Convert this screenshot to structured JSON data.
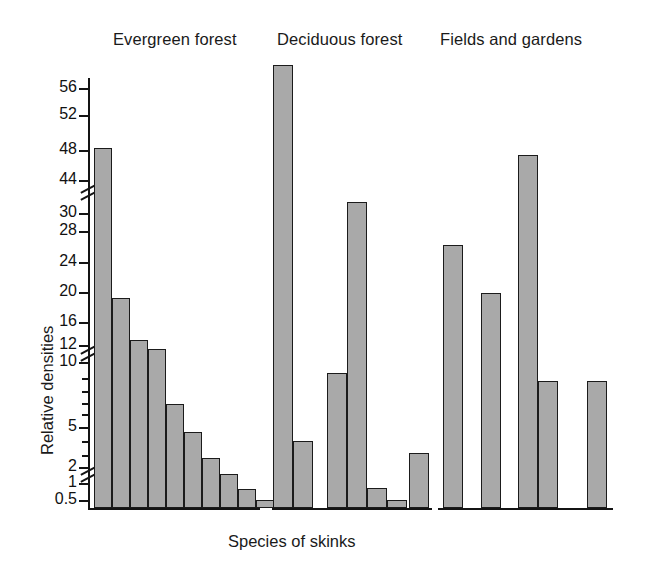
{
  "figure": {
    "xlabel": "Species of skinks",
    "ylabel": "Relative densities"
  },
  "groups": [
    {
      "key": "evergreen",
      "label": "Evergreen forest"
    },
    {
      "key": "deciduous",
      "label": "Deciduous forest"
    },
    {
      "key": "fields",
      "label": "Fields and gardens"
    }
  ],
  "axis": {
    "tick_labels": [
      "56",
      "52",
      "48",
      "44",
      "30",
      "28",
      "24",
      "20",
      "16",
      "12",
      "10",
      "5",
      "2",
      "1",
      "0.5"
    ],
    "breaks": [
      "between 44 and 30",
      "between 12 and 10",
      "between 2 and 1"
    ],
    "minor_ticks": [
      9,
      8,
      7,
      6,
      4,
      3
    ]
  },
  "colors": {
    "bar_fill": "#a9a9a9",
    "bar_stroke": "#1b1b1b",
    "axis": "#141414",
    "text": "#111111",
    "background": "#ffffff"
  },
  "chart_data": {
    "type": "bar",
    "title": "",
    "xlabel": "Species of skinks",
    "ylabel": "Relative densities",
    "ylim": [
      0,
      58
    ],
    "grid": false,
    "legend": "none",
    "y_axis_note": "Broken / compressed axis with three breaks: between 44 and 30, between 12 and 10, and between 2 and 1. Tick spacing below 12 is log-like.",
    "y_tick_labels": [
      "56",
      "52",
      "48",
      "44",
      "30",
      "28",
      "24",
      "20",
      "16",
      "12",
      "10",
      "5",
      "2",
      "1",
      "0.5"
    ],
    "series": [
      {
        "name": "Evergreen forest",
        "categories": [
          "sp1",
          "sp2",
          "sp3",
          "sp4",
          "sp5",
          "sp6",
          "sp7",
          "sp8",
          "sp9",
          "sp10"
        ],
        "values": [
          48,
          17,
          11.5,
          10.5,
          6,
          4,
          2,
          1.3,
          0.8,
          0.4
        ]
      },
      {
        "name": "Deciduous forest",
        "categories": [
          "sp1",
          "sp2",
          "sp3",
          "sp4",
          "sp5",
          "sp6",
          "sp7",
          "sp8"
        ],
        "values": [
          58,
          3,
          8.5,
          31,
          0.8,
          0.3,
          2,
          0
        ]
      },
      {
        "name": "Fields and gardens",
        "categories": [
          "sp1",
          "sp2",
          "sp3",
          "sp4",
          "sp5",
          "sp6",
          "sp7"
        ],
        "values": [
          25,
          18.5,
          47,
          6.5,
          0,
          6.5,
          0
        ]
      }
    ]
  },
  "layout": {
    "group_title_positions": [
      {
        "x": 113,
        "y": 30
      },
      {
        "x": 277,
        "y": 30
      },
      {
        "x": 440,
        "y": 30
      }
    ],
    "ylabel_pos": {
      "x": 38,
      "y": 455
    },
    "xlabel_pos": {
      "x": 228,
      "y": 532
    },
    "baselines": [
      {
        "x": 90,
        "y": 508,
        "w": 170
      },
      {
        "x": 272,
        "y": 508,
        "w": 160
      },
      {
        "x": 438,
        "y": 508,
        "w": 175
      }
    ],
    "axis_line": {
      "x": 88,
      "y": 78,
      "h": 432
    },
    "y_ticks": [
      {
        "label": "56",
        "y": 88,
        "kind": "major"
      },
      {
        "label": "52",
        "y": 115,
        "kind": "major"
      },
      {
        "label": "48",
        "y": 150,
        "kind": "major"
      },
      {
        "label": "44",
        "y": 180,
        "kind": "major"
      },
      {
        "label": "30",
        "y": 213,
        "kind": "major"
      },
      {
        "label": "28",
        "y": 231,
        "kind": "major"
      },
      {
        "label": "24",
        "y": 262,
        "kind": "major"
      },
      {
        "label": "20",
        "y": 292,
        "kind": "major"
      },
      {
        "label": "16",
        "y": 322,
        "kind": "major"
      },
      {
        "label": "12",
        "y": 345,
        "kind": "major"
      },
      {
        "label": "10",
        "y": 362,
        "kind": "major"
      },
      {
        "label": "",
        "y": 378,
        "kind": "minor"
      },
      {
        "label": "",
        "y": 391,
        "kind": "minor"
      },
      {
        "label": "",
        "y": 403,
        "kind": "minor"
      },
      {
        "label": "",
        "y": 414,
        "kind": "minor"
      },
      {
        "label": "5",
        "y": 427,
        "kind": "major"
      },
      {
        "label": "",
        "y": 441,
        "kind": "minor"
      },
      {
        "label": "",
        "y": 455,
        "kind": "minor"
      },
      {
        "label": "2",
        "y": 467,
        "kind": "major"
      },
      {
        "label": "1",
        "y": 483,
        "kind": "major"
      },
      {
        "label": "0.5",
        "y": 500,
        "kind": "major"
      }
    ],
    "breaks": [
      {
        "y": 192
      },
      {
        "y": 353
      },
      {
        "y": 474
      }
    ],
    "bars": [
      {
        "group": "evergreen",
        "x": 94,
        "w": 18,
        "top": 148
      },
      {
        "group": "evergreen",
        "x": 112,
        "w": 18,
        "top": 298
      },
      {
        "group": "evergreen",
        "x": 130,
        "w": 18,
        "top": 340
      },
      {
        "group": "evergreen",
        "x": 148,
        "w": 18,
        "top": 349
      },
      {
        "group": "evergreen",
        "x": 166,
        "w": 18,
        "top": 404
      },
      {
        "group": "evergreen",
        "x": 184,
        "w": 18,
        "top": 432
      },
      {
        "group": "evergreen",
        "x": 202,
        "w": 18,
        "top": 458
      },
      {
        "group": "evergreen",
        "x": 220,
        "w": 18,
        "top": 474
      },
      {
        "group": "evergreen",
        "x": 238,
        "w": 18,
        "top": 489
      },
      {
        "group": "evergreen",
        "x": 256,
        "w": 18,
        "top": 500
      },
      {
        "group": "deciduous",
        "x": 273,
        "w": 20,
        "top": 65
      },
      {
        "group": "deciduous",
        "x": 293,
        "w": 20,
        "top": 441
      },
      {
        "group": "deciduous",
        "x": 327,
        "w": 20,
        "top": 373
      },
      {
        "group": "deciduous",
        "x": 347,
        "w": 20,
        "top": 202
      },
      {
        "group": "deciduous",
        "x": 367,
        "w": 20,
        "top": 488
      },
      {
        "group": "deciduous",
        "x": 387,
        "w": 20,
        "top": 500
      },
      {
        "group": "deciduous",
        "x": 409,
        "w": 20,
        "top": 453
      },
      {
        "group": "fields",
        "x": 443,
        "w": 20,
        "top": 245
      },
      {
        "group": "fields",
        "x": 481,
        "w": 20,
        "top": 293
      },
      {
        "group": "fields",
        "x": 518,
        "w": 20,
        "top": 155
      },
      {
        "group": "fields",
        "x": 538,
        "w": 20,
        "top": 381
      },
      {
        "group": "fields",
        "x": 587,
        "w": 20,
        "top": 381
      }
    ]
  }
}
